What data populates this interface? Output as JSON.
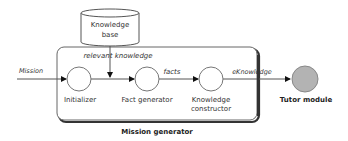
{
  "diagram": {
    "container": {
      "label": "Mission generator"
    },
    "datastore": {
      "line1": "Knowledge",
      "line2": "base"
    },
    "nodes": [
      {
        "id": "initializer",
        "label": "Initializer"
      },
      {
        "id": "fact-generator",
        "label": "Fact generator"
      },
      {
        "id": "knowledge-constructor",
        "label_line1": "Knowledge",
        "label_line2": "constructor"
      },
      {
        "id": "tutor-module",
        "label": "Tutor module"
      }
    ],
    "edges": [
      {
        "from": "external",
        "to": "initializer",
        "label": "Mission"
      },
      {
        "from": "knowledge-base",
        "to": "initializer-fact-generator-link",
        "label": "relevant knowledge"
      },
      {
        "from": "initializer",
        "to": "fact-generator",
        "label": ""
      },
      {
        "from": "fact-generator",
        "to": "knowledge-constructor",
        "label": "facts"
      },
      {
        "from": "knowledge-constructor",
        "to": "tutor-module",
        "label": "eKnowledge"
      }
    ],
    "colors": {
      "stroke": "#555555",
      "container_shadow": "#333333",
      "tutor_fill": "#b3b3b3",
      "node_fill": "#ffffff"
    }
  }
}
